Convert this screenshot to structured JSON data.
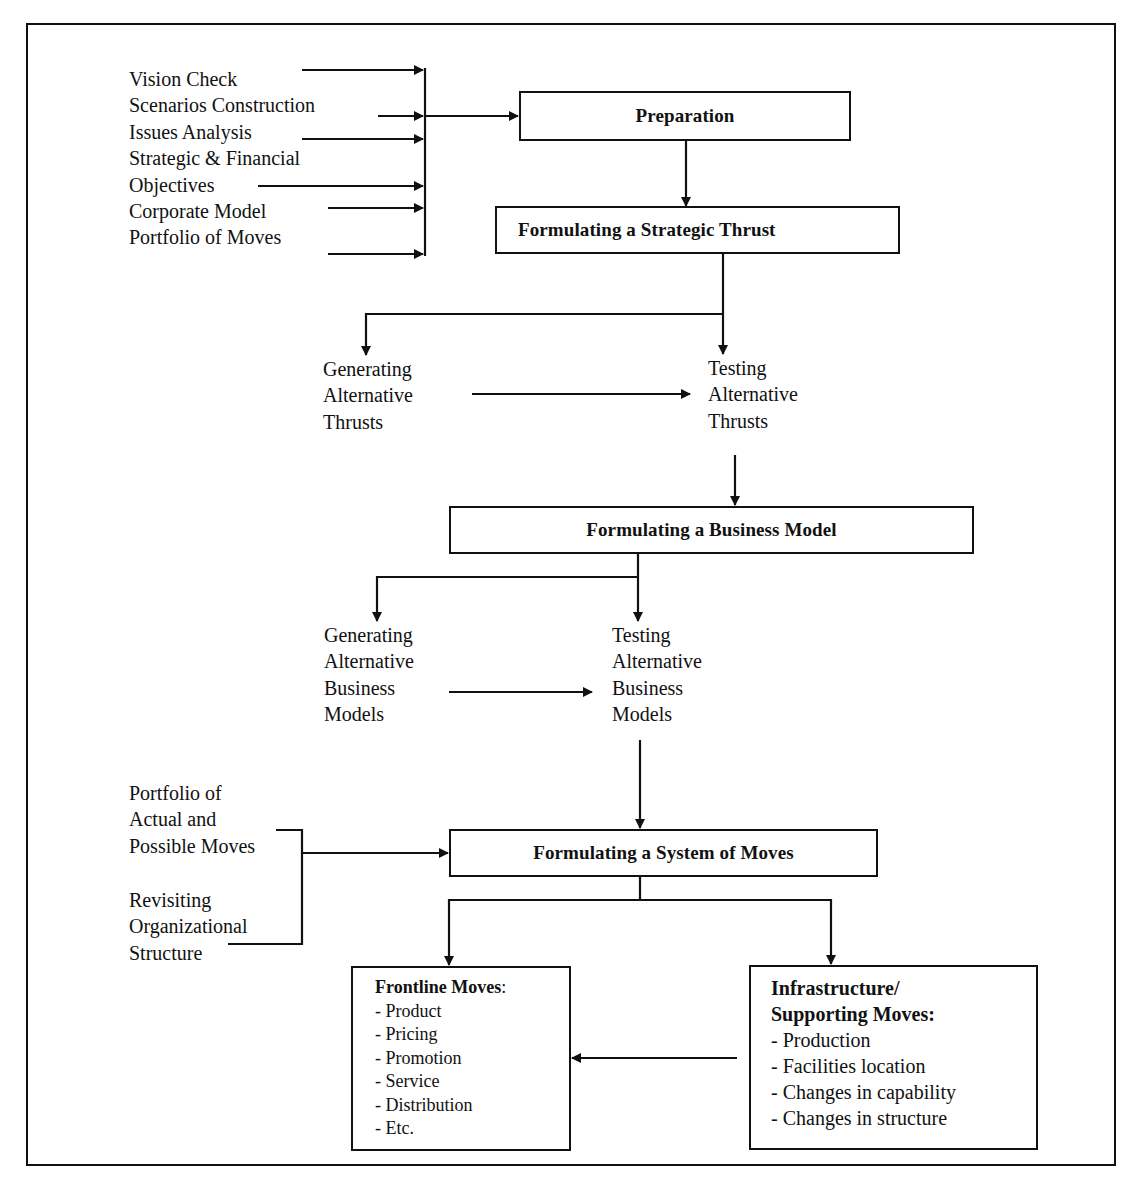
{
  "diagram": {
    "inputs_top": [
      "Vision Check",
      "Scenarios Construction",
      "Issues Analysis",
      "Strategic & Financial",
      "Objectives",
      "Corporate Model",
      "Portfolio of Moves"
    ],
    "nodes": {
      "preparation": "Preparation",
      "strategic_thrust": "Formulating a Strategic Thrust",
      "generating_thrusts": [
        "Generating",
        "Alternative",
        "Thrusts"
      ],
      "testing_thrusts": [
        "Testing",
        "Alternative",
        "Thrusts"
      ],
      "business_model": "Formulating a Business Model",
      "generating_models": [
        "Generating",
        "Alternative",
        "Business",
        "Models"
      ],
      "testing_models": [
        "Testing",
        "Alternative",
        "Business",
        "Models"
      ],
      "system_of_moves": "Formulating a System of Moves"
    },
    "inputs_moves": {
      "portfolio": [
        "Portfolio of",
        "Actual and",
        "Possible Moves"
      ],
      "revisiting": [
        "Revisiting",
        "Organizational",
        "Structure"
      ]
    },
    "frontline": {
      "title": "Frontline Moves",
      "colon": ":",
      "items": [
        "- Product",
        "- Pricing",
        "- Promotion",
        "- Service",
        "- Distribution",
        "- Etc."
      ]
    },
    "infrastructure": {
      "title_line1": "Infrastructure/",
      "title_line2": "Supporting Moves:",
      "items": [
        "- Production",
        "- Facilities location",
        "- Changes in capability",
        "- Changes in structure"
      ]
    },
    "colors": {
      "line": "#111111",
      "background": "#ffffff"
    }
  }
}
